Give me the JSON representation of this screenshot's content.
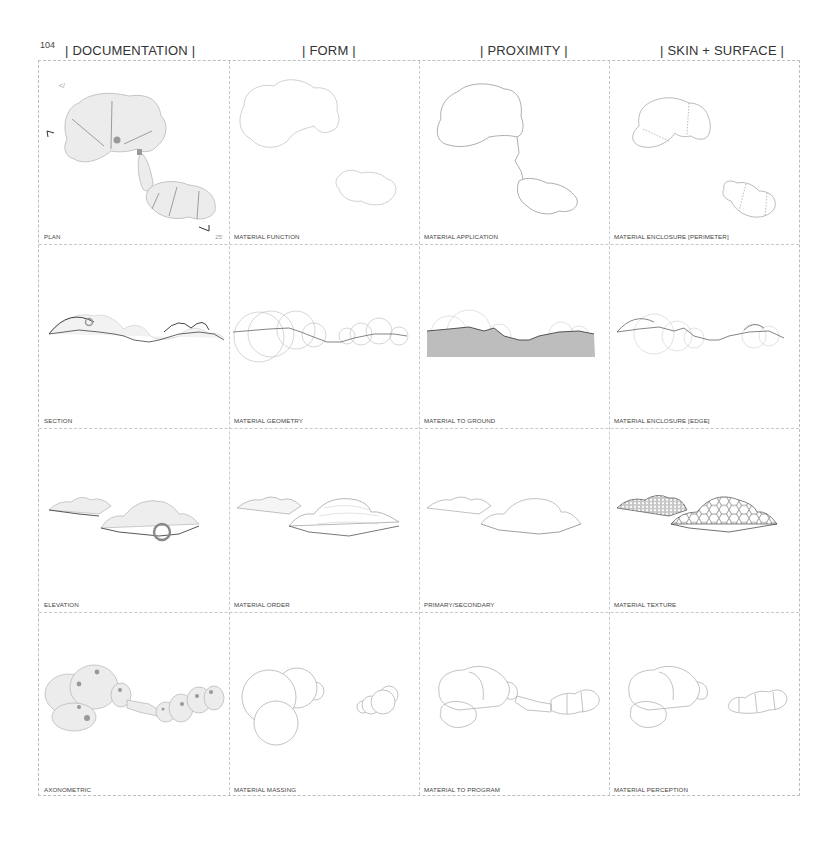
{
  "page": {
    "page_number": "104"
  },
  "headers": [
    {
      "label": "| DOCUMENTATION |"
    },
    {
      "label": "| FORM |"
    },
    {
      "label": "| PROXIMITY |"
    },
    {
      "label": "| SKIN + SURFACE |"
    }
  ],
  "rows": [
    {
      "cells": [
        {
          "label": "PLAN",
          "drawing": "plan",
          "scale": "25'",
          "north": "N"
        },
        {
          "label": "MATERIAL FUNCTION",
          "drawing": "function-outline"
        },
        {
          "label": "MATERIAL APPLICATION",
          "drawing": "application-outline"
        },
        {
          "label": "MATERIAL ENCLOSURE [PERIMETER]",
          "drawing": "enclosure-perimeter"
        }
      ]
    },
    {
      "cells": [
        {
          "label": "SECTION",
          "drawing": "section"
        },
        {
          "label": "MATERIAL GEOMETRY",
          "drawing": "geometry-circles"
        },
        {
          "label": "MATERIAL TO GROUND",
          "drawing": "ground-section"
        },
        {
          "label": "MATERIAL ENCLOSURE [EDGE]",
          "drawing": "enclosure-edge"
        }
      ]
    },
    {
      "cells": [
        {
          "label": "ELEVATION",
          "drawing": "elevation"
        },
        {
          "label": "MATERIAL ORDER",
          "drawing": "order-elevation"
        },
        {
          "label": "PRIMARY/SECONDARY",
          "drawing": "primary-secondary"
        },
        {
          "label": "MATERIAL TEXTURE",
          "drawing": "texture-hex"
        }
      ]
    },
    {
      "cells": [
        {
          "label": "AXONOMETRIC",
          "drawing": "axonometric"
        },
        {
          "label": "MATERIAL MASSING",
          "drawing": "massing-circles"
        },
        {
          "label": "MATERIAL TO PROGRAM",
          "drawing": "program-outline"
        },
        {
          "label": "MATERIAL PERCEPTION",
          "drawing": "perception-outline"
        }
      ]
    }
  ],
  "colors": {
    "line_light": "#b8b8b8",
    "line_dark": "#555555",
    "fill_light": "#ececec",
    "ground_fill": "#bdbdbd",
    "highlight": "#8a8a8a"
  }
}
